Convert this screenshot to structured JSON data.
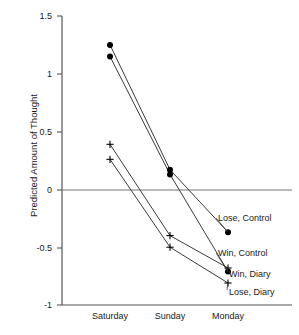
{
  "chart_data": {
    "type": "line",
    "title": "",
    "xlabel": "",
    "ylabel": "Predicted Amount of Thought",
    "categories": [
      "Saturday",
      "Sunday",
      "Monday"
    ],
    "ylim": [
      -1,
      1.5
    ],
    "yticks": [
      1.5,
      1,
      0.5,
      0,
      -0.5,
      -1
    ],
    "ytick_labels": [
      "1.5",
      "1",
      "0.5",
      "0",
      "-0.5",
      "-1"
    ],
    "grid": false,
    "zero_line": true,
    "legend_position": "inline-right",
    "series": [
      {
        "name": "Lose, Control",
        "marker": "circle",
        "values": [
          1.25,
          0.17,
          -0.37
        ]
      },
      {
        "name": "Win, Control",
        "marker": "circle",
        "values": [
          1.15,
          0.13,
          -0.71
        ]
      },
      {
        "name": "Win, Diary",
        "marker": "plus",
        "values": [
          0.39,
          -0.4,
          -0.68
        ]
      },
      {
        "name": "Lose, Diary",
        "marker": "plus",
        "values": [
          0.26,
          -0.5,
          -0.81
        ]
      }
    ]
  },
  "axis": {
    "y_title": "Predicted Amount of Thought",
    "y_ticks": [
      {
        "label": "1.5",
        "value": 1.5
      },
      {
        "label": "1",
        "value": 1
      },
      {
        "label": "0.5",
        "value": 0.5
      },
      {
        "label": "0",
        "value": 0
      },
      {
        "label": "-0.5",
        "value": -0.5
      },
      {
        "label": "-1",
        "value": -1
      }
    ],
    "x_ticks": [
      {
        "label": "Saturday"
      },
      {
        "label": "Sunday"
      },
      {
        "label": "Monday"
      }
    ]
  },
  "legend": [
    {
      "label": "Lose, Control"
    },
    {
      "label": "Win, Control"
    },
    {
      "label": "Win, Diary"
    },
    {
      "label": "Lose, Diary"
    }
  ],
  "colors": {
    "line": "#3a3a3a",
    "axis": "#555555",
    "marker": "#000000",
    "text": "#1a1a1a",
    "background": "#ffffff"
  }
}
